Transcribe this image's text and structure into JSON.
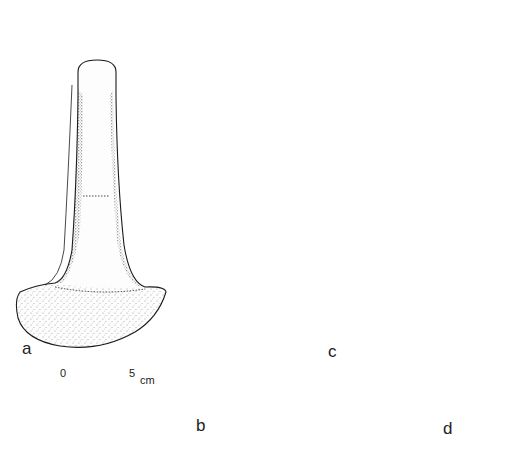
{
  "figure": {
    "artifacts": [
      {
        "id": "a",
        "label": "a",
        "type": "flat axe"
      },
      {
        "id": "b",
        "label": "b",
        "type": "riveted blade with three rivets"
      },
      {
        "id": "c",
        "label": "c",
        "type": "tanged spearhead"
      },
      {
        "id": "d",
        "label": "d",
        "type": "socketed spearhead"
      }
    ],
    "rivets": {
      "count": 3
    }
  },
  "scale_bar": {
    "start_label": "0",
    "end_label": "5",
    "unit": "cm",
    "ticks": 6
  },
  "colors": {
    "ink": "#1a1a1a",
    "background": "#ffffff"
  }
}
